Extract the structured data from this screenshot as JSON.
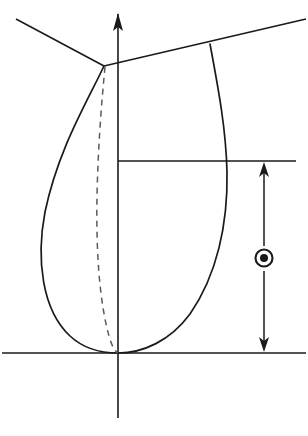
{
  "figure": {
    "background_color": "#ffffff",
    "line_color": "#1a1a1a",
    "dashed_line_color": "#5a5a5a",
    "width": 308,
    "height": 436
  },
  "symbols": {
    "out_of_page_vector": {
      "name": "circled-dot",
      "glyph": "⊙",
      "meaning": "vector out of page",
      "center_x": 264,
      "center_y": 258,
      "outer_radius": 9,
      "inner_radius": 4
    }
  },
  "axis": {
    "vertical": {
      "label": "vertical-axis",
      "x": 118,
      "top_y": 14,
      "bottom_y": 418,
      "arrow_at": "top",
      "arrow_half_width": 5,
      "arrow_length": 17
    },
    "baseline": {
      "label": "baseline",
      "y": 353,
      "x_start": 2,
      "x_end": 306
    },
    "midline": {
      "label": "mid-horizontal-line",
      "y": 161,
      "x_start": 118,
      "x_end": 296
    }
  },
  "boundary_lines": {
    "upper_left": {
      "label": "upper-left-boundary",
      "points": "16,19 104,66"
    },
    "upper_right": {
      "label": "upper-right-boundary",
      "points": "104,66 306,19"
    }
  },
  "curves": {
    "left_profile": {
      "label": "left-profile-curve",
      "style": "solid",
      "path": "M 104,66 C 86,104 58,150 45,212 C 36,259 42,310 70,336 C 85,350 104,353 118,353"
    },
    "right_profile": {
      "label": "right-profile-curve",
      "style": "solid",
      "path": "M 210,44 C 219,92 226,130 227,172 C 228,224 217,275 190,314 C 170,341 143,353 118,353"
    },
    "hidden_inner": {
      "label": "hidden-inner-curve",
      "style": "dashed",
      "path": "M 105,67 C 101,108 98,150 97,196 C 96,248 99,300 109,336 C 112,347 115,351 118,353"
    }
  },
  "dimension": {
    "label": "vertical-dimension",
    "x": 264,
    "top_y": 162,
    "bottom_y": 352,
    "upper_segment_end_y": 246,
    "lower_segment_start_y": 271,
    "arrow_half_width": 5,
    "arrow_length": 14,
    "arrows": "both-ends",
    "value_text": ""
  }
}
